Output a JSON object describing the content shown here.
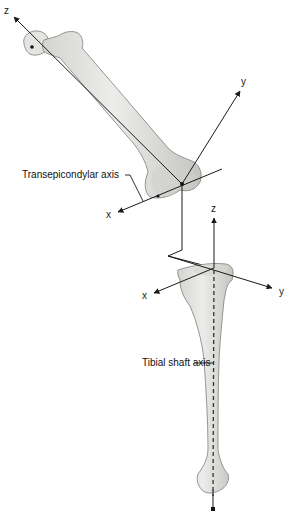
{
  "figure": {
    "labels": {
      "transepicondylar_axis": "Transepicondylar axis",
      "tibial_shaft_axis": "Tibial shaft axis"
    },
    "femur_axes": {
      "z": "z",
      "y": "y",
      "x": "x"
    },
    "tibia_axes": {
      "z": "z",
      "y": "y",
      "x": "x"
    },
    "colors": {
      "bone_fill": "#e6e6e4",
      "bone_shade": "#c9c9c6",
      "bone_outline": "#8a8a88",
      "line": "#1a1a1a"
    }
  }
}
